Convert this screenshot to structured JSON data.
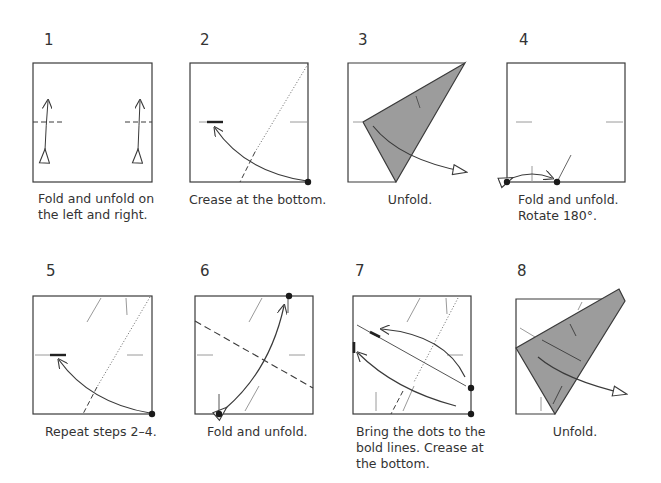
{
  "colors": {
    "line": "#3a3a3a",
    "crease": "#9a9a9a",
    "flap_fill": "#9c9c9c",
    "dot": "#1a1a1a"
  },
  "steps": [
    {
      "number": "1",
      "caption": "Fold and unfold on\nthe left and right."
    },
    {
      "number": "2",
      "caption": "Crease at the bottom."
    },
    {
      "number": "3",
      "caption": "Unfold."
    },
    {
      "number": "4",
      "caption": "Fold and unfold.\nRotate 180°."
    },
    {
      "number": "5",
      "caption": "Repeat steps 2–4."
    },
    {
      "number": "6",
      "caption": "Fold and unfold."
    },
    {
      "number": "7",
      "caption": "Bring the dots to the\nbold lines. Crease at\nthe bottom."
    },
    {
      "number": "8",
      "caption": "Unfold."
    }
  ]
}
